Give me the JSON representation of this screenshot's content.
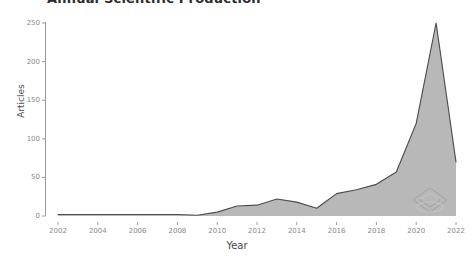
{
  "chart_data": {
    "type": "area",
    "title": "Annual Scientific Production",
    "xlabel": "Year",
    "ylabel": "Articles",
    "grid": false,
    "legend": null,
    "legend_position": "none",
    "xlim": [
      2002,
      2022
    ],
    "ylim": [
      0,
      250
    ],
    "x_ticks": [
      "2002",
      "2004",
      "2006",
      "2008",
      "2010",
      "2012",
      "2014",
      "2016",
      "2018",
      "2020",
      "2022"
    ],
    "y_ticks": [
      "0",
      "50",
      "100",
      "150",
      "200",
      "250"
    ],
    "x": [
      2002,
      2003,
      2004,
      2005,
      2006,
      2007,
      2008,
      2009,
      2010,
      2011,
      2012,
      2013,
      2014,
      2015,
      2016,
      2017,
      2018,
      2019,
      2020,
      2021,
      2022
    ],
    "values": [
      2,
      2,
      2,
      2,
      2,
      2,
      2,
      1,
      5,
      13,
      14,
      22,
      18,
      10,
      29,
      34,
      41,
      57,
      120,
      250,
      70
    ],
    "series": [
      {
        "name": "Articles",
        "values": [
          2,
          2,
          2,
          2,
          2,
          2,
          2,
          1,
          5,
          13,
          14,
          22,
          18,
          10,
          29,
          34,
          41,
          57,
          120,
          250,
          70
        ]
      }
    ],
    "colors": {
      "area_fill": "#b4b4b4",
      "line_stroke": "#4d4d4d",
      "axis": "#9a9a9a",
      "tick_text": "#8a8a8a",
      "label_text": "#4a4a4a",
      "title_text": "#2b2b2b",
      "background": "#ffffff"
    }
  },
  "watermark": {
    "name": "bibliometrix-logo-watermark"
  }
}
